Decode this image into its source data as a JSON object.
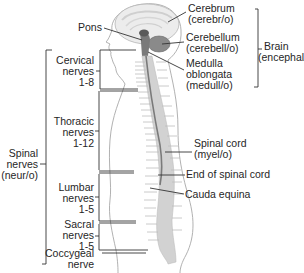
{
  "diagram": {
    "labels": {
      "pons": "Pons",
      "cerebrum": {
        "name": "Cerebrum",
        "root": "(cerebr/o)"
      },
      "cerebellum": {
        "name": "Cerebellum",
        "root": "(cerebell/o)"
      },
      "medulla": {
        "line1": "Medulla",
        "line2": "oblongata",
        "root": "(medull/o)"
      },
      "brain": {
        "name": "Brain",
        "root": "(encephal/o)"
      },
      "cervical": {
        "line1": "Cervical",
        "line2": "nerves",
        "range": "1-8"
      },
      "thoracic": {
        "line1": "Thoracic",
        "line2": "nerves",
        "range": "1-12"
      },
      "spinal_nerves": {
        "line1": "Spinal",
        "line2": "nerves",
        "root": "(neur/o)"
      },
      "lumbar": {
        "line1": "Lumbar",
        "line2": "nerves",
        "range": "1-5"
      },
      "sacral": {
        "line1": "Sacral",
        "line2": "nerves",
        "range": "1-5"
      },
      "coccygeal": {
        "line1": "Coccygeal",
        "line2": "nerve"
      },
      "spinal_cord": {
        "name": "Spinal cord",
        "root": "(myel/o)"
      },
      "end_of_cord": "End of spinal cord",
      "cauda_equina": "Cauda equina"
    },
    "colors": {
      "line": "#333333",
      "body_outline": "#9a9a9a",
      "brain_fill": "#e6e6e6",
      "spine_fill": "#c8c8c8",
      "cord_dark": "#6a6a6a"
    }
  }
}
